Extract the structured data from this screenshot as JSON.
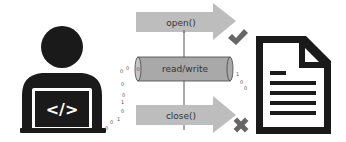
{
  "diagram": {
    "operations": {
      "open": {
        "label": "open()",
        "status_icon": "check-icon"
      },
      "read_write": {
        "label": "read/write"
      },
      "close": {
        "label": "close()",
        "status_icon": "cross-icon"
      }
    },
    "programmer": {
      "icon": "developer-laptop-icon",
      "screen_text": "</>"
    },
    "file": {
      "icon": "document-icon"
    },
    "bits_left": [
      "0",
      "0",
      "0",
      "0",
      "1",
      "0",
      "1",
      "0",
      "0"
    ],
    "bits_right": [
      "1",
      "0",
      "0"
    ],
    "cylinder_end_bit": "0"
  },
  "colors": {
    "arrow_fill": "#bdbdbd",
    "cylinder_fill": "#a9a9a9",
    "icon_dark": "#1a1a1a",
    "status_icon": "#666666",
    "background": "#ffffff"
  }
}
